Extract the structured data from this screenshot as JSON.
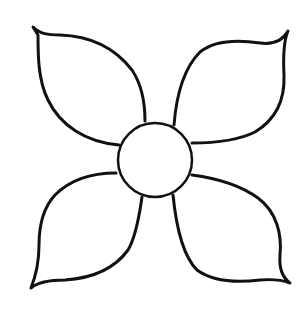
{
  "image": {
    "title": "Four-petal flower outline",
    "width": 308,
    "height": 312,
    "background": "#ffffff",
    "stroke_color": "#111111"
  },
  "flower": {
    "center": {
      "cx": 155,
      "cy": 160,
      "r": 37
    },
    "petals": [
      {
        "name": "top-left",
        "tip": [
          33,
          27
        ]
      },
      {
        "name": "top-right",
        "tip": [
          288,
          31
        ]
      },
      {
        "name": "bottom-left",
        "tip": [
          31,
          288
        ]
      },
      {
        "name": "bottom-right",
        "tip": [
          290,
          283
        ]
      }
    ]
  }
}
